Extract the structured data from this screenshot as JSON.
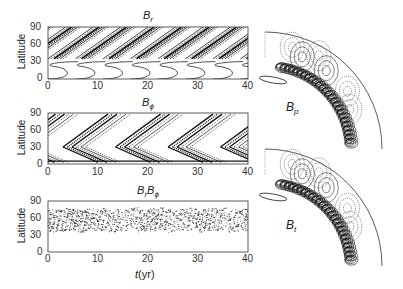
{
  "chart_data": [
    {
      "type": "heatmap",
      "subtype": "contour butterfly diagram",
      "title": "B_r",
      "xlabel": "",
      "ylabel": "Latitude",
      "xlim": [
        0,
        40
      ],
      "ylim": [
        0,
        90
      ],
      "xticks": [
        0,
        10,
        20,
        30,
        40
      ],
      "yticks": [
        0,
        30,
        60,
        90
      ],
      "description": "Poleward-migrating dense bands between ~35-90 deg latitude; open C-shaped contours near equator repeating every ~5.5 yr",
      "cycle_period_yr": 5.5
    },
    {
      "type": "heatmap",
      "subtype": "contour butterfly diagram",
      "title": "B_phi",
      "xlabel": "",
      "ylabel": "Latitude",
      "xlim": [
        0,
        40
      ],
      "ylim": [
        0,
        90
      ],
      "xticks": [
        0,
        10,
        20,
        30,
        40
      ],
      "yticks": [
        0,
        30,
        60,
        90
      ],
      "description": "Equatorward and poleward branches forming chevron (V) patterns centered near 30 deg latitude, repeating every ~11 yr",
      "cycle_period_yr": 11
    },
    {
      "type": "heatmap",
      "subtype": "contour / stipple",
      "title": "B_r B_phi",
      "xlabel": "t (yr)",
      "ylabel": "Latitude",
      "xlim": [
        0,
        40
      ],
      "ylim": [
        0,
        90
      ],
      "xticks": [
        0,
        10,
        20,
        30,
        40
      ],
      "yticks": [
        0,
        30,
        60,
        90
      ],
      "description": "Dense stippled band between ~35 and ~75 deg latitude, center ~55 deg",
      "band_range_deg": [
        35,
        75
      ]
    },
    {
      "type": "heatmap",
      "subtype": "meridional-plane contours (quarter disc)",
      "title": "B_p",
      "description": "Field contours concentrated along a curved layer near base of convection zone; solid and dotted lobes"
    },
    {
      "type": "heatmap",
      "subtype": "meridional-plane contours (quarter disc)",
      "title": "B_t",
      "description": "Toroidal field contours concentrated along the same curved layer; solid and dotted lobes"
    }
  ],
  "panels": {
    "br": {
      "title_main": "B",
      "title_sub": "r",
      "ylabel": "Latitude"
    },
    "bphi": {
      "title_main": "B",
      "title_sub": "ϕ",
      "ylabel": "Latitude"
    },
    "brbphi": {
      "title_main1": "B",
      "title_sub1": "r",
      "title_main2": "B",
      "title_sub2": "ϕ",
      "ylabel": "Latitude",
      "xlabel_var": "t",
      "xlabel_unit": "(yr)"
    },
    "bp": {
      "label_main": "B",
      "label_sub": "p"
    },
    "bt": {
      "label_main": "B",
      "label_sub": "t"
    }
  },
  "ticks": {
    "x": [
      "0",
      "10",
      "20",
      "30",
      "40"
    ],
    "y": [
      "0",
      "30",
      "60",
      "90"
    ]
  }
}
